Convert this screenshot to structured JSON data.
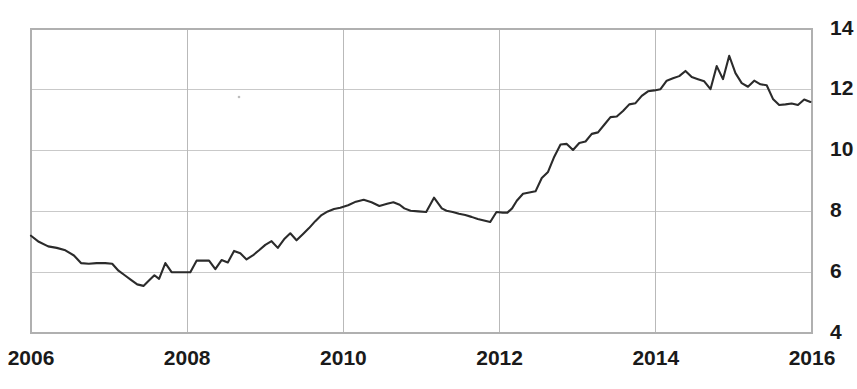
{
  "chart_data": {
    "type": "line",
    "title": "",
    "subtitle": "",
    "xlabel": "",
    "ylabel": "",
    "xlim": [
      2006,
      2016
    ],
    "ylim": [
      4,
      14
    ],
    "grid": true,
    "legend": false,
    "legend_position": "none",
    "line_color": "#2b2b2b",
    "grid_color": "#c9c9c9",
    "background_color": "#ffffff",
    "x_ticks": [
      2006,
      2008,
      2010,
      2012,
      2014,
      2016
    ],
    "x_tick_labels": [
      "2006",
      "2008",
      "2010",
      "2012",
      "2014",
      "2016"
    ],
    "y_ticks": [
      4,
      6,
      8,
      10,
      12,
      14
    ],
    "y_tick_labels": [
      "4",
      "6",
      "8",
      "10",
      "12",
      "14"
    ],
    "series": [
      {
        "name": "series-1",
        "color": "#2b2b2b",
        "x": [
          2006.0,
          2006.1,
          2006.22,
          2006.33,
          2006.44,
          2006.55,
          2006.64,
          2006.74,
          2006.84,
          2006.95,
          2007.04,
          2007.12,
          2007.2,
          2007.28,
          2007.36,
          2007.44,
          2007.52,
          2007.58,
          2007.64,
          2007.72,
          2007.8,
          2007.88,
          2007.96,
          2008.04,
          2008.12,
          2008.2,
          2008.28,
          2008.36,
          2008.44,
          2008.52,
          2008.6,
          2008.68,
          2008.76,
          2008.84,
          2008.92,
          2009.0,
          2009.08,
          2009.16,
          2009.24,
          2009.32,
          2009.4,
          2009.48,
          2009.56,
          2009.64,
          2009.72,
          2009.8,
          2009.88,
          2009.96,
          2010.06,
          2010.16,
          2010.26,
          2010.36,
          2010.46,
          2010.56,
          2010.64,
          2010.72,
          2010.78,
          2010.86,
          2010.96,
          2011.06,
          2011.16,
          2011.26,
          2011.32,
          2011.4,
          2011.48,
          2011.56,
          2011.64,
          2011.72,
          2011.8,
          2011.88,
          2011.96,
          2012.04,
          2012.1,
          2012.16,
          2012.22,
          2012.3,
          2012.38,
          2012.46,
          2012.54,
          2012.62,
          2012.7,
          2012.78,
          2012.86,
          2012.94,
          2013.02,
          2013.1,
          2013.18,
          2013.26,
          2013.34,
          2013.42,
          2013.5,
          2013.58,
          2013.66,
          2013.74,
          2013.82,
          2013.9,
          2013.98,
          2014.06,
          2014.14,
          2014.22,
          2014.3,
          2014.38,
          2014.46,
          2014.54,
          2014.62,
          2014.7,
          2014.78,
          2014.86,
          2014.94,
          2015.02,
          2015.1,
          2015.18,
          2015.26,
          2015.34,
          2015.42,
          2015.5,
          2015.58,
          2015.66,
          2015.74,
          2015.82,
          2015.9,
          2015.98
        ],
        "y": [
          7.2,
          7.0,
          6.85,
          6.8,
          6.72,
          6.55,
          6.3,
          6.28,
          6.3,
          6.3,
          6.28,
          6.05,
          5.9,
          5.75,
          5.6,
          5.55,
          5.75,
          5.9,
          5.78,
          6.3,
          6.0,
          6.0,
          6.0,
          6.0,
          6.38,
          6.38,
          6.38,
          6.1,
          6.4,
          6.32,
          6.7,
          6.62,
          6.42,
          6.55,
          6.72,
          6.9,
          7.02,
          6.8,
          7.08,
          7.28,
          7.05,
          7.25,
          7.45,
          7.68,
          7.88,
          8.0,
          8.08,
          8.12,
          8.2,
          8.32,
          8.38,
          8.3,
          8.18,
          8.25,
          8.3,
          8.22,
          8.1,
          8.02,
          8.0,
          7.98,
          8.45,
          8.1,
          8.02,
          7.98,
          7.92,
          7.88,
          7.82,
          7.75,
          7.7,
          7.65,
          7.98,
          7.96,
          7.96,
          8.1,
          8.35,
          8.58,
          8.62,
          8.66,
          9.1,
          9.3,
          9.8,
          10.2,
          10.22,
          10.02,
          10.25,
          10.3,
          10.55,
          10.6,
          10.85,
          11.1,
          11.12,
          11.3,
          11.52,
          11.56,
          11.8,
          11.95,
          11.98,
          12.02,
          12.3,
          12.38,
          12.45,
          12.62,
          12.42,
          12.35,
          12.28,
          12.02,
          12.78,
          12.35,
          13.12,
          12.55,
          12.22,
          12.1,
          12.3,
          12.18,
          12.15,
          11.7,
          11.5,
          11.52,
          11.55,
          11.5,
          11.68,
          11.6
        ]
      }
    ]
  },
  "axes": {
    "y_axis_name": "value-axis",
    "x_axis_name": "year-axis"
  }
}
